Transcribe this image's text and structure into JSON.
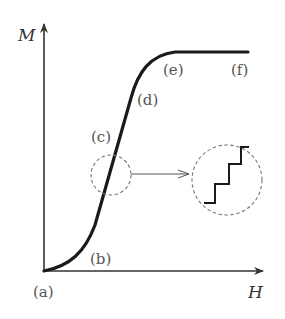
{
  "diagram": {
    "type": "magnetization-curve",
    "axes": {
      "y_label": "M",
      "x_label": "H"
    },
    "point_labels": [
      {
        "id": "a",
        "text": "(a)"
      },
      {
        "id": "b",
        "text": "(b)"
      },
      {
        "id": "c",
        "text": "(c)"
      },
      {
        "id": "d",
        "text": "(d)"
      },
      {
        "id": "e",
        "text": "(e)"
      },
      {
        "id": "f",
        "text": "(f)"
      }
    ],
    "inset": {
      "description": "magnified view of region (c) showing step-like (Barkhausen) jumps"
    },
    "colors": {
      "curve": "#1a1a1a",
      "axes": "#333333",
      "dashed": "#777777",
      "labels": "#555555"
    }
  }
}
